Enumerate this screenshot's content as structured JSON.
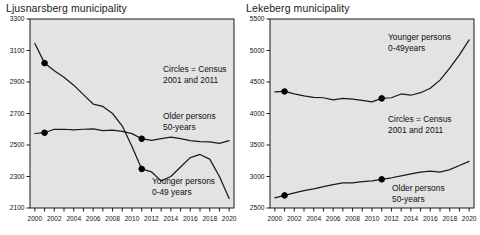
{
  "figure": {
    "background_color": "#ffffff",
    "plot_background_color": "#e3e3e3",
    "line_color": "#1a1a1a",
    "marker_color": "#000000",
    "axis_color": "#1a1a1a"
  },
  "panels": [
    {
      "id": "ljusnarsberg",
      "title": "Ljusnarsberg municipality",
      "annotations": [
        {
          "name": "census-note",
          "lines": [
            "Circles = Census",
            "2001 and 2011"
          ],
          "x": 163,
          "y": 72
        },
        {
          "name": "older-persons-label",
          "lines": [
            "Older persons",
            "50-years"
          ],
          "x": 163,
          "y": 119
        },
        {
          "name": "younger-persons-label",
          "lines": [
            "Younger persons",
            "0-49 years"
          ],
          "x": 152,
          "y": 184
        }
      ]
    },
    {
      "id": "lekeberg",
      "title": "Lekeberg municipality",
      "annotations": [
        {
          "name": "younger-persons-label",
          "lines": [
            "Younger persons",
            "0-49years"
          ],
          "x": 388,
          "y": 40
        },
        {
          "name": "census-note",
          "lines": [
            "Circles = Census",
            "2001 and 2011"
          ],
          "x": 388,
          "y": 122
        },
        {
          "name": "older-persons-label",
          "lines": [
            "Older persons",
            "50-years"
          ],
          "x": 392,
          "y": 191
        }
      ]
    }
  ],
  "chart_data": [
    {
      "type": "line",
      "title": "Ljusnarsberg municipality",
      "xlabel": "",
      "ylabel": "",
      "xlim": [
        1999.5,
        2020.5
      ],
      "ylim": [
        2100,
        3300
      ],
      "yticks": [
        2100,
        2300,
        2500,
        2700,
        2900,
        3100,
        3300
      ],
      "xticks": [
        2000,
        2002,
        2004,
        2006,
        2008,
        2010,
        2012,
        2014,
        2016,
        2018,
        2020
      ],
      "xticks_minor_step": 1,
      "grid": false,
      "legend_position": "inline-annotations",
      "annotations": [
        "Circles = Census 2001 and 2011",
        "Older persons 50-years",
        "Younger persons 0-49 years"
      ],
      "x": [
        2000,
        2001,
        2002,
        2003,
        2004,
        2005,
        2006,
        2007,
        2008,
        2009,
        2010,
        2011,
        2012,
        2013,
        2014,
        2015,
        2016,
        2017,
        2018,
        2019,
        2020
      ],
      "series": [
        {
          "name": "Younger persons 0-49 years",
          "values": [
            3145,
            3020,
            2972,
            2930,
            2880,
            2820,
            2760,
            2745,
            2700,
            2620,
            2490,
            2348,
            2330,
            2272,
            2300,
            2360,
            2420,
            2440,
            2410,
            2300,
            2160
          ]
        },
        {
          "name": "Older persons 50-years",
          "values": [
            2573,
            2578,
            2600,
            2600,
            2596,
            2600,
            2602,
            2592,
            2594,
            2586,
            2572,
            2540,
            2530,
            2540,
            2550,
            2540,
            2528,
            2522,
            2520,
            2510,
            2528
          ]
        }
      ],
      "markers": [
        {
          "series": "Younger persons 0-49 years",
          "x": 2001,
          "y": 3020,
          "label": "Census 2001"
        },
        {
          "series": "Younger persons 0-49 years",
          "x": 2011,
          "y": 2348,
          "label": "Census 2011"
        },
        {
          "series": "Older persons 50-years",
          "x": 2001,
          "y": 2578,
          "label": "Census 2001"
        },
        {
          "series": "Older persons 50-years",
          "x": 2011,
          "y": 2540,
          "label": "Census 2011"
        }
      ]
    },
    {
      "type": "line",
      "title": "Lekeberg municipality",
      "xlabel": "",
      "ylabel": "",
      "xlim": [
        1999.5,
        2020.5
      ],
      "ylim": [
        2500,
        5500
      ],
      "yticks": [
        2500,
        3000,
        3500,
        4000,
        4500,
        5000,
        5500
      ],
      "xticks": [
        2000,
        2002,
        2004,
        2006,
        2008,
        2010,
        2012,
        2014,
        2016,
        2018,
        2020
      ],
      "xticks_minor_step": 1,
      "grid": false,
      "legend_position": "inline-annotations",
      "annotations": [
        "Younger persons 0-49years",
        "Circles = Census 2001 and 2011",
        "Older persons 50-years"
      ],
      "x": [
        2000,
        2001,
        2002,
        2003,
        2004,
        2005,
        2006,
        2007,
        2008,
        2009,
        2010,
        2011,
        2012,
        2013,
        2014,
        2015,
        2016,
        2017,
        2018,
        2019,
        2020
      ],
      "series": [
        {
          "name": "Younger persons 0-49years",
          "values": [
            4345,
            4350,
            4310,
            4280,
            4255,
            4250,
            4215,
            4240,
            4230,
            4210,
            4185,
            4240,
            4250,
            4310,
            4290,
            4330,
            4400,
            4530,
            4720,
            4930,
            5170
          ]
        },
        {
          "name": "Older persons 50-years",
          "values": [
            2660,
            2700,
            2740,
            2775,
            2805,
            2840,
            2870,
            2900,
            2900,
            2920,
            2930,
            2955,
            2980,
            3010,
            3040,
            3070,
            3085,
            3070,
            3110,
            3175,
            3240
          ]
        }
      ],
      "markers": [
        {
          "series": "Younger persons 0-49years",
          "x": 2001,
          "y": 4350,
          "label": "Census 2001"
        },
        {
          "series": "Younger persons 0-49years",
          "x": 2011,
          "y": 4240,
          "label": "Census 2011"
        },
        {
          "series": "Older persons 50-years",
          "x": 2001,
          "y": 2700,
          "label": "Census 2001"
        },
        {
          "series": "Older persons 50-years",
          "x": 2011,
          "y": 2955,
          "label": "Census 2011"
        }
      ]
    }
  ]
}
